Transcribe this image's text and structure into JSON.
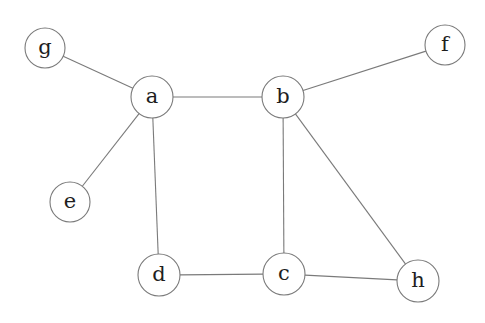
{
  "diagram": {
    "type": "undirected-graph",
    "nodes": [
      {
        "id": "g",
        "label": "g",
        "x": 45,
        "y": 48,
        "r": 20
      },
      {
        "id": "a",
        "label": "a",
        "x": 152,
        "y": 97,
        "r": 21
      },
      {
        "id": "b",
        "label": "b",
        "x": 283,
        "y": 97,
        "r": 21
      },
      {
        "id": "f",
        "label": "f",
        "x": 445,
        "y": 45,
        "r": 20
      },
      {
        "id": "e",
        "label": "e",
        "x": 70,
        "y": 202,
        "r": 20
      },
      {
        "id": "d",
        "label": "d",
        "x": 159,
        "y": 275,
        "r": 21
      },
      {
        "id": "c",
        "label": "c",
        "x": 284,
        "y": 274,
        "r": 21
      },
      {
        "id": "h",
        "label": "h",
        "x": 418,
        "y": 281,
        "r": 21
      }
    ],
    "edges": [
      {
        "from": "g",
        "to": "a"
      },
      {
        "from": "a",
        "to": "b"
      },
      {
        "from": "b",
        "to": "f"
      },
      {
        "from": "a",
        "to": "e"
      },
      {
        "from": "a",
        "to": "d"
      },
      {
        "from": "b",
        "to": "c"
      },
      {
        "from": "b",
        "to": "h"
      },
      {
        "from": "d",
        "to": "c"
      },
      {
        "from": "c",
        "to": "h"
      }
    ]
  }
}
